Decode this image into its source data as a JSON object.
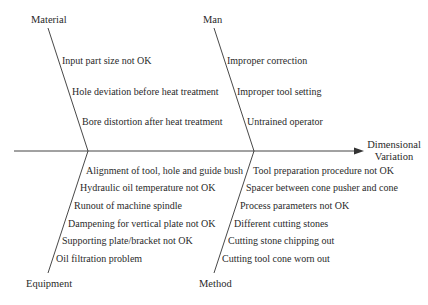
{
  "diagram": {
    "type": "fishbone",
    "effect": {
      "line1": "Dimensional",
      "line2": "Variation"
    },
    "categories": {
      "material": {
        "label": "Material",
        "causes": [
          "Input part size not OK",
          "Hole deviation before heat treatment",
          "Bore distortion after heat treatment"
        ]
      },
      "man": {
        "label": "Man",
        "causes": [
          "Improper correction",
          "Improper tool setting",
          "Untrained operator"
        ]
      },
      "equipment": {
        "label": "Equipment",
        "causes": [
          "Alignment of tool, hole and guide bush",
          "Hydraulic oil temperature not OK",
          "Runout of machine spindle",
          "Dampening for vertical plate not OK",
          "Supporting plate/bracket not OK",
          "Oil filtration problem"
        ]
      },
      "method": {
        "label": "Method",
        "causes": [
          "Tool preparation procedure not OK",
          "Spacer between cone pusher and cone",
          "Process parameters not OK",
          "Different cutting stones",
          "Cutting stone chipping out",
          "Cutting tool cone worn out"
        ]
      }
    },
    "colors": {
      "line": "#333333",
      "text": "#2a2a2a",
      "background": "#ffffff"
    }
  }
}
